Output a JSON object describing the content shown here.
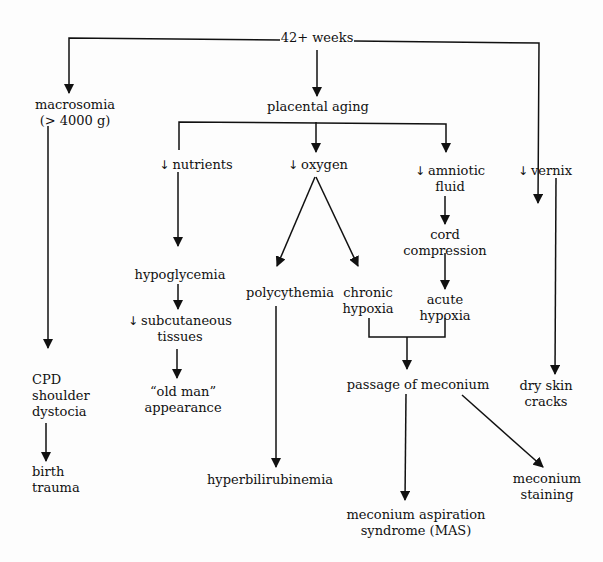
{
  "diagram": {
    "root": "42+ weeks",
    "nodes": {
      "macrosomia": [
        "macrosomia",
        "(> 4000 g)"
      ],
      "placental_aging": "placental aging",
      "nutrients": "nutrients",
      "oxygen": "oxygen",
      "amniotic": [
        "amniotic",
        "fluid"
      ],
      "vernix": "vernix",
      "hypoglycemia": "hypoglycemia",
      "subcutaneous": [
        "subcutaneous",
        "tissues"
      ],
      "old_man": [
        "“old man”",
        "appearance"
      ],
      "cord": [
        "cord",
        "compression"
      ],
      "polycythemia": "polycythemia",
      "chronic": [
        "chronic",
        "hypoxia"
      ],
      "acute": [
        "acute",
        "hypoxia"
      ],
      "cpd": [
        "CPD",
        "shoulder",
        "dystocia"
      ],
      "birth": [
        "birth",
        "trauma"
      ],
      "meconium_passage": "passage of meconium",
      "dry_skin": [
        "dry skin",
        "cracks"
      ],
      "hyperbili": "hyperbilirubinemia",
      "mas": [
        "meconium aspiration",
        "syndrome (MAS)"
      ],
      "staining": [
        "meconium",
        "staining"
      ]
    },
    "decrease_symbol": "↓"
  }
}
